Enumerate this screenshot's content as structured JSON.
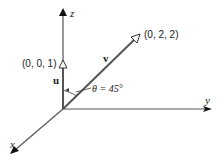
{
  "diagram": {
    "axes": {
      "x": {
        "label": "x"
      },
      "y": {
        "label": "y"
      },
      "z": {
        "label": "z"
      }
    },
    "vectors": {
      "u": {
        "name": "u",
        "endpoint_label": "(0, 0, 1)"
      },
      "v": {
        "name": "v",
        "endpoint_label": "(0, 2, 2)"
      }
    },
    "angle": {
      "label": "θ = 45°"
    },
    "colors": {
      "line": "#555555",
      "text": "#1a1a1a",
      "background": "#ffffff"
    }
  }
}
